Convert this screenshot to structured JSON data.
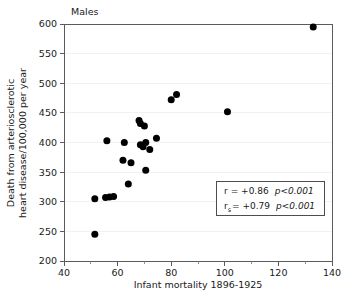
{
  "panel": {
    "label": "Males"
  },
  "chart_data": {
    "type": "scatter",
    "title": "Males",
    "xlabel": "Infant mortality 1896-1925",
    "ylabel": "Death from arteriosclerotic heart disease/100,000 per year",
    "ylabel_line1": "Death from arteriosclerotic",
    "ylabel_line2": "heart disease/100,000 per year",
    "xlim": [
      40,
      140
    ],
    "ylim": [
      200,
      600
    ],
    "xticks": [
      40,
      60,
      80,
      100,
      120,
      140
    ],
    "xticklabels": [
      "40",
      "60",
      "80",
      "100",
      "120",
      "140"
    ],
    "xminorticks": [
      50,
      70,
      90,
      110,
      130
    ],
    "yticks": [
      200,
      250,
      300,
      350,
      400,
      450,
      500,
      550,
      600
    ],
    "yticklabels": [
      "200",
      "250",
      "300",
      "350",
      "400",
      "450",
      "500",
      "550",
      "600"
    ],
    "grid": "horizontal-faint",
    "legend_position": "lower-right",
    "marker": "filled-circle",
    "marker_color": "#000000",
    "marker_size": 7,
    "points": [
      {
        "x": 51.5,
        "y": 245
      },
      {
        "x": 51.5,
        "y": 305
      },
      {
        "x": 55.5,
        "y": 307
      },
      {
        "x": 57.0,
        "y": 308
      },
      {
        "x": 58.5,
        "y": 309
      },
      {
        "x": 56.0,
        "y": 403
      },
      {
        "x": 62.0,
        "y": 370
      },
      {
        "x": 62.5,
        "y": 400
      },
      {
        "x": 64.0,
        "y": 330
      },
      {
        "x": 65.0,
        "y": 366
      },
      {
        "x": 68.0,
        "y": 437
      },
      {
        "x": 68.5,
        "y": 432
      },
      {
        "x": 68.5,
        "y": 396
      },
      {
        "x": 69.5,
        "y": 393
      },
      {
        "x": 70.0,
        "y": 428
      },
      {
        "x": 70.5,
        "y": 400
      },
      {
        "x": 70.5,
        "y": 353
      },
      {
        "x": 72.0,
        "y": 388
      },
      {
        "x": 74.5,
        "y": 407
      },
      {
        "x": 80.0,
        "y": 472
      },
      {
        "x": 82.0,
        "y": 481
      },
      {
        "x": 101.0,
        "y": 452
      },
      {
        "x": 133.0,
        "y": 595
      }
    ],
    "annotations": [
      {
        "symbol": "r",
        "subscript": "",
        "equals": "= +0.86",
        "pvalue": "p<0.001"
      },
      {
        "symbol": "r",
        "subscript": "s",
        "equals": "= +0.79",
        "pvalue": "p<0.001"
      }
    ]
  },
  "legend": {
    "row1_symbol": "r",
    "row1_value": "= +0.86",
    "row1_p": "p<0.001",
    "row2_symbol": "r",
    "row2_subscript": "s",
    "row2_value": "= +0.79",
    "row2_p": "p<0.001"
  },
  "colors": {
    "marker": "#000000",
    "axis": "#5b5b5b",
    "grid": "#f2f2f4",
    "text": "#1a1a1a",
    "legend_border": "#4d4d4d",
    "background": "#ffffff"
  }
}
